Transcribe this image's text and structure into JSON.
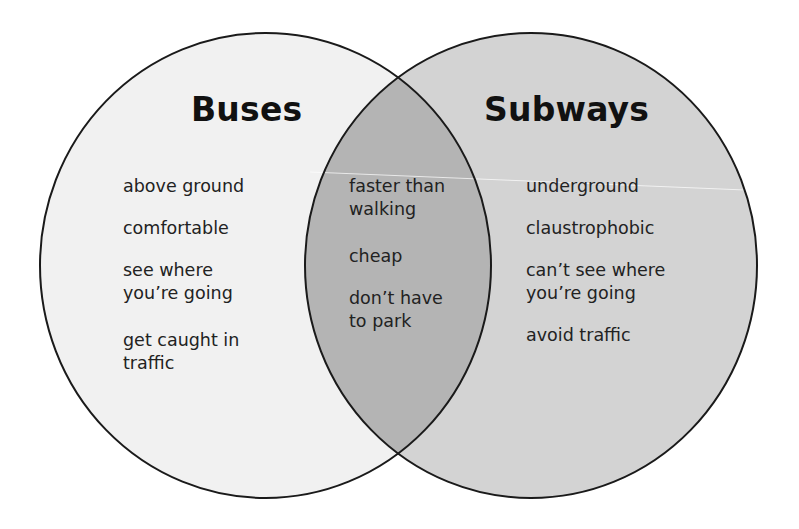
{
  "diagram": {
    "type": "venn",
    "colors": {
      "left_fill": "#f1f1f1",
      "right_fill": "#d3d3d3",
      "overlap_fill": "#b4b4b4",
      "outline": "#1a1a1a",
      "background": "#ffffff"
    },
    "left": {
      "title": "Buses",
      "items": [
        "above ground",
        "comfortable",
        "see where\nyou’re going",
        "get caught in\ntraffic"
      ]
    },
    "overlap": {
      "items": [
        "faster than\nwalking",
        "cheap",
        "don’t have\nto park"
      ]
    },
    "right": {
      "title": "Subways",
      "items": [
        "underground",
        "claustrophobic",
        "can’t see where\nyou’re going",
        "avoid traffic"
      ]
    }
  }
}
